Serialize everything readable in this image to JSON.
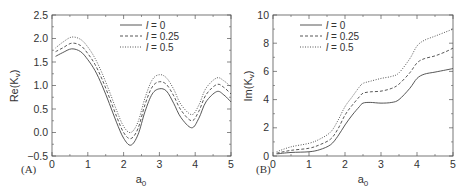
{
  "chart_data": [
    {
      "type": "line",
      "panel": "(A)",
      "title": "",
      "xlabel": "a0",
      "ylabel": "Re(Kv)",
      "xlim": [
        0,
        5
      ],
      "ylim": [
        -0.5,
        2.5
      ],
      "xticks": [
        "0",
        "1",
        "2",
        "3",
        "4",
        "5"
      ],
      "yticks": [
        "-0.5",
        "0.0",
        "0.5",
        "1.0",
        "1.5",
        "2.0",
        "2.5"
      ],
      "grid": false,
      "legend_position": "upper center",
      "x": [
        0.1,
        0.3,
        0.55,
        0.8,
        1.0,
        1.2,
        1.4,
        1.6,
        1.8,
        2.0,
        2.2,
        2.4,
        2.6,
        2.8,
        3.0,
        3.2,
        3.4,
        3.6,
        3.9,
        4.1,
        4.3,
        4.6,
        4.8,
        5.0
      ],
      "series": [
        {
          "name": "l = 0",
          "style": "solid",
          "values": [
            1.62,
            1.7,
            1.78,
            1.72,
            1.55,
            1.32,
            1.0,
            0.62,
            0.22,
            -0.12,
            -0.27,
            -0.05,
            0.45,
            0.82,
            0.93,
            0.88,
            0.62,
            0.32,
            0.1,
            0.3,
            0.65,
            0.87,
            0.8,
            0.65
          ]
        },
        {
          "name": "l = 0.25",
          "style": "dashed",
          "values": [
            1.72,
            1.8,
            1.9,
            1.85,
            1.68,
            1.45,
            1.13,
            0.75,
            0.35,
            0.0,
            -0.13,
            0.08,
            0.6,
            0.97,
            1.08,
            1.02,
            0.78,
            0.48,
            0.25,
            0.45,
            0.8,
            1.02,
            0.96,
            0.82
          ]
        },
        {
          "name": "l = 0.5",
          "style": "dotted",
          "values": [
            1.8,
            1.92,
            2.03,
            1.98,
            1.82,
            1.58,
            1.26,
            0.88,
            0.48,
            0.13,
            0.0,
            0.22,
            0.74,
            1.12,
            1.23,
            1.16,
            0.92,
            0.6,
            0.38,
            0.58,
            0.94,
            1.16,
            1.1,
            0.97
          ]
        }
      ]
    },
    {
      "type": "line",
      "panel": "(B)",
      "title": "",
      "xlabel": "a0",
      "ylabel": "Im(Kv)",
      "xlim": [
        0,
        5
      ],
      "ylim": [
        0,
        10
      ],
      "xticks": [
        "0",
        "1",
        "2",
        "3",
        "4",
        "5"
      ],
      "yticks": [
        "0",
        "2",
        "4",
        "6",
        "8",
        "10"
      ],
      "grid": false,
      "legend_position": "upper left",
      "x": [
        0.1,
        0.5,
        1.0,
        1.3,
        1.6,
        1.8,
        2.0,
        2.2,
        2.4,
        2.5,
        2.7,
        3.0,
        3.3,
        3.5,
        3.8,
        4.0,
        4.2,
        4.5,
        4.8,
        5.0
      ],
      "series": [
        {
          "name": "l = 0",
          "style": "solid",
          "values": [
            0.15,
            0.25,
            0.3,
            0.45,
            0.8,
            1.4,
            2.2,
            2.9,
            3.5,
            3.75,
            3.8,
            3.75,
            3.8,
            4.0,
            4.8,
            5.5,
            5.8,
            5.95,
            6.1,
            6.2
          ]
        },
        {
          "name": "l = 0.25",
          "style": "dashed",
          "values": [
            0.2,
            0.4,
            0.55,
            0.8,
            1.2,
            1.9,
            2.9,
            3.6,
            4.2,
            4.45,
            4.55,
            4.6,
            4.8,
            5.1,
            5.9,
            6.6,
            6.9,
            7.1,
            7.4,
            7.65
          ]
        },
        {
          "name": "l = 0.5",
          "style": "dotted",
          "values": [
            0.3,
            0.65,
            0.9,
            1.2,
            1.7,
            2.5,
            3.5,
            4.2,
            4.9,
            5.15,
            5.3,
            5.5,
            5.65,
            5.9,
            6.9,
            7.8,
            8.2,
            8.5,
            8.8,
            9.0
          ]
        }
      ]
    }
  ],
  "panels": {
    "a": {
      "label": "(A)",
      "ylabel_main": "Re(K",
      "ylabel_sub": "v",
      "ylabel_end": ")",
      "xlabel_main": "a",
      "xlabel_sub": "0",
      "legend": [
        "l = 0",
        "l = 0.25",
        "l = 0.5"
      ]
    },
    "b": {
      "label": "(B)",
      "ylabel_main": "Im(K",
      "ylabel_sub": "v",
      "ylabel_end": ")",
      "xlabel_main": "a",
      "xlabel_sub": "0",
      "legend": [
        "l = 0",
        "l = 0.25",
        "l = 0.5"
      ]
    }
  },
  "colors": {
    "axis": "#555555",
    "curve": "#444444",
    "text": "#333333"
  }
}
